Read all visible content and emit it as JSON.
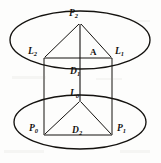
{
  "figure": {
    "kind": "geometry-diagram",
    "background_color": "#fdfdfc",
    "stroke_color": "#14120f",
    "labels": {
      "p2": {
        "base": "P",
        "sub": "2",
        "x": 73,
        "y": 15
      },
      "l2": {
        "base": "L",
        "sub": "2",
        "x": 34,
        "y": 53
      },
      "l1": {
        "base": "L",
        "sub": "1",
        "x": 114,
        "y": 53
      },
      "a": {
        "base": "A",
        "sub": "",
        "x": 93,
        "y": 53
      },
      "d1": {
        "base": "D",
        "sub": "1",
        "x": 73,
        "y": 73
      },
      "l0": {
        "base": "L",
        "sub": "0",
        "x": 73,
        "y": 95
      },
      "p0": {
        "base": "P",
        "sub": "0",
        "x": 34,
        "y": 128
      },
      "p1": {
        "base": "P",
        "sub": "1",
        "x": 116,
        "y": 128
      },
      "d2": {
        "base": "D",
        "sub": "2",
        "x": 76,
        "y": 131
      }
    },
    "shapes": {
      "upper_ellipse": {
        "cx": 80,
        "cy": 40,
        "rx": 70,
        "ry": 29
      },
      "lower_ellipse": {
        "cx": 80,
        "cy": 122,
        "rx": 66,
        "ry": 27
      },
      "upper_triangle": {
        "apex": {
          "x": 80,
          "y": 24
        },
        "left": {
          "x": 44,
          "y": 58
        },
        "right": {
          "x": 112,
          "y": 58
        }
      },
      "lower_triangle": {
        "apex": {
          "x": 80,
          "y": 102
        },
        "left": {
          "x": 44,
          "y": 135
        },
        "right": {
          "x": 112,
          "y": 135
        }
      },
      "horizontal_upper": {
        "x1": 44,
        "y1": 58,
        "x2": 112,
        "y2": 58
      },
      "horizontal_lower": {
        "x1": 44,
        "y1": 135,
        "x2": 112,
        "y2": 135
      },
      "vertical_center": {
        "x1": 80,
        "y1": 24,
        "x2": 80,
        "y2": 102
      },
      "vertical_left": {
        "x1": 44,
        "y1": 58,
        "x2": 44,
        "y2": 135
      },
      "vertical_right": {
        "x1": 112,
        "y1": 58,
        "x2": 112,
        "y2": 135
      }
    }
  }
}
